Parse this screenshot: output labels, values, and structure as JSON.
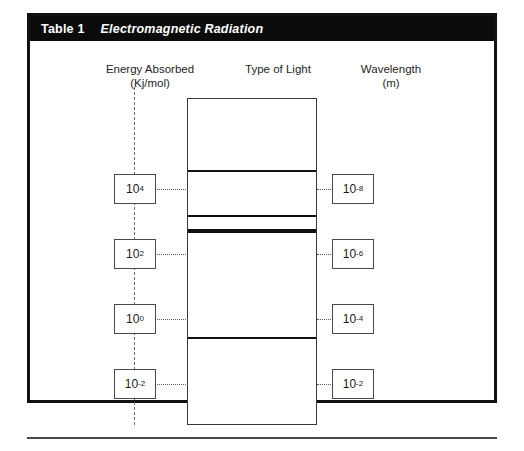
{
  "table": {
    "label": "Table 1",
    "title": "Electromagnetic Radiation",
    "title_bar_color": "#0b0b0b",
    "title_text_color": "#ffffff",
    "frame_color": "#111111"
  },
  "columns": {
    "left_heading": "Energy Absorbed\n(Kj/mol)",
    "center_heading": "Type of Light",
    "right_heading": "Wavelength\n(m)"
  },
  "energy_axis": {
    "style": "dashed",
    "color": "#6d6d6d",
    "values": [
      {
        "base": "10",
        "exponent": "4",
        "y": 133
      },
      {
        "base": "10",
        "exponent": "2",
        "y": 198
      },
      {
        "base": "10",
        "exponent": "0",
        "y": 263
      },
      {
        "base": "10",
        "exponent": "-2",
        "y": 328
      }
    ]
  },
  "wavelength_axis": {
    "values": [
      {
        "base": "10",
        "exponent": "-8",
        "y": 133
      },
      {
        "base": "10",
        "exponent": "-6",
        "y": 198
      },
      {
        "base": "10",
        "exponent": "-4",
        "y": 263
      },
      {
        "base": "10",
        "exponent": "-2",
        "y": 328
      }
    ]
  },
  "spectrum": {
    "border_color": "#3a3a3a",
    "band_color": "#111111",
    "bands": [
      {
        "name": "band-1",
        "y": 71,
        "thickness": 2
      },
      {
        "name": "band-2",
        "y": 116,
        "thickness": 2
      },
      {
        "name": "band-3",
        "y": 130,
        "thickness": 4
      },
      {
        "name": "band-4",
        "y": 238,
        "thickness": 2
      }
    ]
  },
  "connectors": {
    "style": "dotted",
    "color": "#5a5a5a",
    "rows_y": [
      148,
      213,
      278,
      343
    ]
  }
}
